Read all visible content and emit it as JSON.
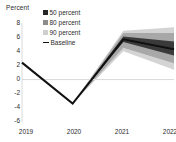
{
  "chart_data": {
    "type": "area",
    "title": "",
    "subtitle": "",
    "ylabel": "Percent",
    "xlabel": "",
    "grid": false,
    "zero_line": true,
    "legend_position": "top-left",
    "x": [
      2019,
      2020,
      2021,
      2022
    ],
    "xtick_labels": [
      "2019",
      "2020",
      "2021",
      "2022"
    ],
    "ytick_labels": [
      "8",
      "6",
      "4",
      "2",
      "0",
      "-2",
      "-4",
      "-6"
    ],
    "ytick_values": [
      8,
      6,
      4,
      2,
      0,
      -2,
      -4,
      -6
    ],
    "ylim": [
      -6,
      8
    ],
    "xlim": [
      2019,
      2022
    ],
    "series": [
      {
        "name": "Baseline",
        "type": "line",
        "color": "#111111",
        "values": [
          2.4,
          -3.4,
          5.7,
          4.3
        ]
      }
    ],
    "bands": [
      {
        "name": "90 percent",
        "color": "#d4d4d4",
        "lower": [
          2.4,
          -3.4,
          4.0,
          1.4
        ],
        "upper": [
          2.4,
          -3.4,
          6.9,
          7.4
        ]
      },
      {
        "name": "80 percent",
        "color": "#a8a8a8",
        "lower": [
          2.4,
          -3.4,
          4.5,
          2.3
        ],
        "upper": [
          2.4,
          -3.4,
          6.6,
          6.6
        ]
      },
      {
        "name": "50 percent",
        "color": "#3a3a3a",
        "lower": [
          2.4,
          -3.4,
          5.3,
          3.4
        ],
        "upper": [
          2.4,
          -3.4,
          6.1,
          5.4
        ]
      }
    ],
    "legend": [
      {
        "label": "50 percent",
        "color": "#262626",
        "marker": "square"
      },
      {
        "label": "80 percent",
        "color": "#8c8c8c",
        "marker": "square"
      },
      {
        "label": "90 percent",
        "color": "#cfcfcf",
        "marker": "square"
      },
      {
        "label": "Baseline",
        "color": "#111111",
        "marker": "line"
      }
    ]
  },
  "axis": {
    "y_title": "Percent"
  },
  "colors": {
    "text": "#2b2b2b",
    "zero_line": "#d9d9d9",
    "axis_line": "#d0d0d0",
    "baseline": "#111111"
  }
}
